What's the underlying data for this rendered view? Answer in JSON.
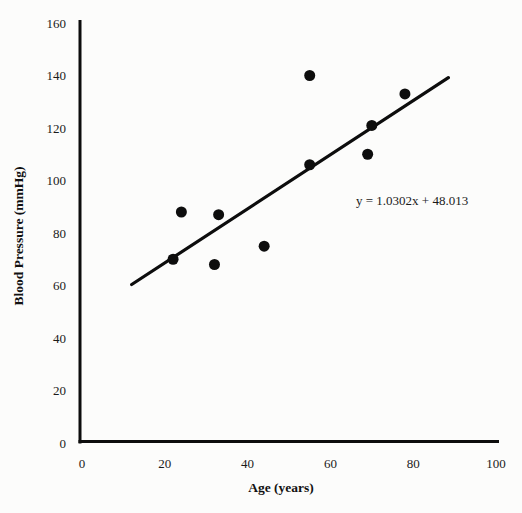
{
  "chart_data": {
    "type": "scatter",
    "title": "",
    "xlabel": "Age (years)",
    "ylabel": "Blood Pressure (mmHg)",
    "xlim": [
      0,
      100
    ],
    "ylim": [
      0,
      160
    ],
    "xticks": [
      0,
      20,
      40,
      60,
      80,
      100
    ],
    "yticks": [
      0,
      20,
      40,
      60,
      80,
      100,
      120,
      140,
      160
    ],
    "grid": false,
    "legend": "none",
    "points": [
      {
        "x": 22,
        "y": 70
      },
      {
        "x": 24,
        "y": 88
      },
      {
        "x": 32,
        "y": 68
      },
      {
        "x": 33,
        "y": 87
      },
      {
        "x": 44,
        "y": 75
      },
      {
        "x": 55,
        "y": 106
      },
      {
        "x": 55,
        "y": 140
      },
      {
        "x": 69,
        "y": 110
      },
      {
        "x": 70,
        "y": 121
      },
      {
        "x": 78,
        "y": 133
      }
    ],
    "trendline": {
      "label": "y = 1.0302x + 48.013",
      "slope": 1.0302,
      "intercept": 48.013,
      "x_start": 12,
      "x_end": 88.5
    },
    "colors": {
      "points": "#0d0d0d",
      "trendline": "#0d0d0d",
      "axes": "#0d0d0d",
      "text": "#1a1a1a",
      "background": "#fcfcfb"
    }
  }
}
